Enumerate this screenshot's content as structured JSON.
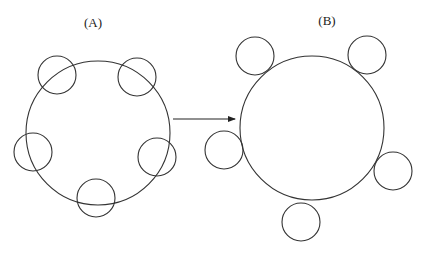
{
  "panels": {
    "a": {
      "label": "(A)",
      "label_pos": [
        93,
        23
      ],
      "main_circle": {
        "cx": 98,
        "cy": 133,
        "r": 72
      },
      "small_circles": [
        {
          "cx": 57,
          "cy": 75,
          "r": 19
        },
        {
          "cx": 137,
          "cy": 77,
          "r": 19
        },
        {
          "cx": 33,
          "cy": 152,
          "r": 19
        },
        {
          "cx": 157,
          "cy": 157,
          "r": 19
        },
        {
          "cx": 96,
          "cy": 198,
          "r": 19
        }
      ]
    },
    "b": {
      "label": "(B)",
      "label_pos": [
        327,
        21
      ],
      "main_circle": {
        "cx": 312,
        "cy": 128,
        "r": 72
      },
      "small_circles": [
        {
          "cx": 255,
          "cy": 56,
          "r": 19
        },
        {
          "cx": 367,
          "cy": 55,
          "r": 19
        },
        {
          "cx": 224,
          "cy": 150,
          "r": 19
        },
        {
          "cx": 393,
          "cy": 171,
          "r": 19
        },
        {
          "cx": 301,
          "cy": 222,
          "r": 19
        }
      ]
    }
  },
  "arrow": {
    "x1": 173,
    "y1": 119,
    "x2": 235,
    "y2": 119,
    "color": "#222222"
  },
  "stroke_color": "#333333"
}
